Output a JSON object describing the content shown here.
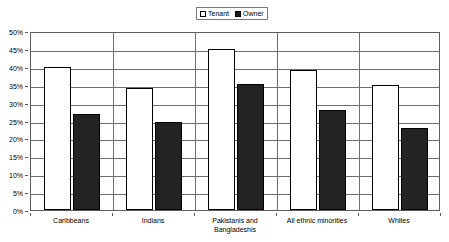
{
  "chart_data": {
    "type": "bar",
    "title": "",
    "subtitle": "",
    "xlabel": "",
    "ylabel": "",
    "ylim": [
      0,
      50
    ],
    "y_tick_labels": [
      "50%",
      "45%",
      "40%",
      "35%",
      "30%",
      "25%",
      "20%",
      "15%",
      "10%",
      "5%",
      "0%"
    ],
    "y_tick_values": [
      50,
      45,
      40,
      35,
      30,
      25,
      20,
      15,
      10,
      5,
      0
    ],
    "grid": true,
    "legend_position": "top-center",
    "categories": [
      "Caribbeans",
      "Indians",
      "Pakistanis and\nBangladeshis",
      "All ethnic minorities",
      "Whites"
    ],
    "series": [
      {
        "name": "Tenant",
        "color": "#ffffff",
        "values": [
          40.0,
          34.0,
          45.0,
          39.0,
          35.0
        ]
      },
      {
        "name": "Owner",
        "color": "#232323",
        "values": [
          26.8,
          24.7,
          35.3,
          28.0,
          23.0
        ]
      }
    ]
  },
  "legend": {
    "entries": [
      {
        "label": "Tenant",
        "swatch": "hollow-square-icon"
      },
      {
        "label": "Owner",
        "swatch": "filled-square-icon"
      }
    ]
  },
  "colors": {
    "tenant_fill": "#ffffff",
    "owner_fill": "#232323",
    "axis_line": "#5e5e5e",
    "gridline": "#6e6e6e",
    "background": "#ffffff",
    "text": "#000000"
  }
}
